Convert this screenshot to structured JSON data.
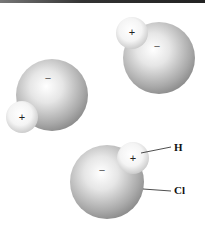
{
  "figure": {
    "molecules": [
      {
        "id": "m1",
        "cl": {
          "cx": 159,
          "cy": 58,
          "r": 36,
          "charge": "−"
        },
        "h": {
          "cx": 132,
          "cy": 33,
          "r": 16,
          "charge": "+"
        }
      },
      {
        "id": "m2",
        "cl": {
          "cx": 52,
          "cy": 95,
          "r": 36,
          "charge": "−"
        },
        "h": {
          "cx": 22,
          "cy": 117,
          "r": 16,
          "charge": "+"
        }
      },
      {
        "id": "m3",
        "cl": {
          "cx": 107,
          "cy": 182,
          "r": 37,
          "charge": "−"
        },
        "h": {
          "cx": 133,
          "cy": 158,
          "r": 16,
          "charge": "+"
        }
      }
    ],
    "labels": {
      "h": "H",
      "cl": "Cl"
    },
    "colors": {
      "sphere_light": "#ffffff",
      "sphere_mid": "#d6d6d6",
      "sphere_dark": "#8e8e8e",
      "h_light": "#ffffff",
      "h_dark": "#cfcfcf",
      "line": "#222222"
    }
  }
}
